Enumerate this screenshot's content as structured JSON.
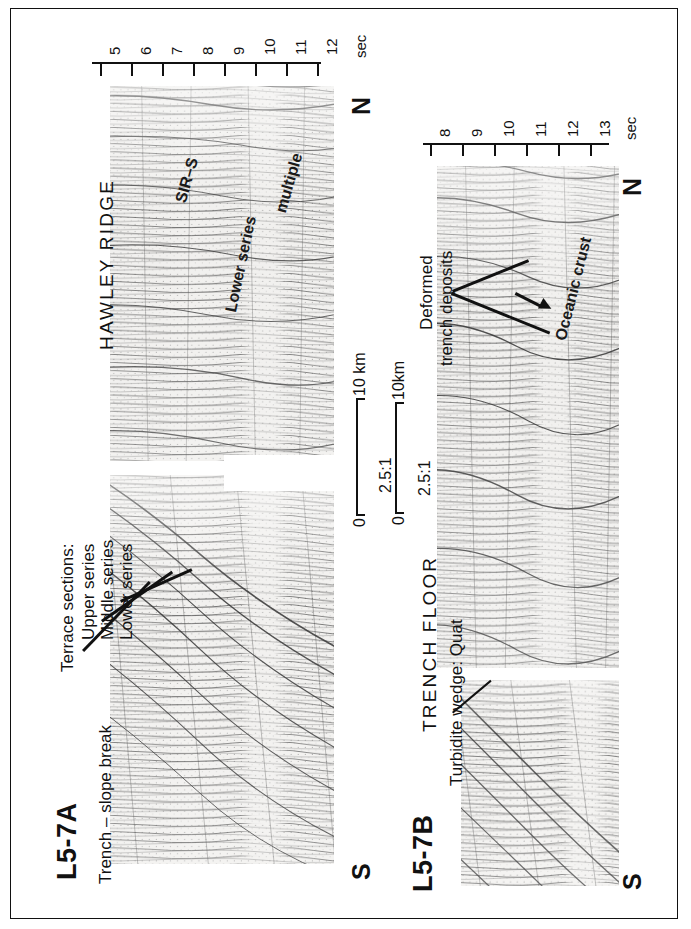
{
  "figure": {
    "orientation": "rotated-90-ccw",
    "background": "#ffffff",
    "ink": "#111111"
  },
  "panels": [
    {
      "id": "L5-7A",
      "title": "L5-7A",
      "region_label": "HAWLEY RIDGE",
      "axis": {
        "unit_label": "sec",
        "ticks": [
          "5",
          "6",
          "7",
          "8",
          "9",
          "10",
          "11",
          "12"
        ],
        "min": 5,
        "max": 12
      },
      "direction_start": "S",
      "direction_end": "N",
      "scale": {
        "zero_label": "0",
        "length_label": "10 km",
        "exaggeration": "2.5:1"
      },
      "annotations": [
        {
          "name": "trench-slope-break",
          "text": "Trench – slope break"
        },
        {
          "name": "terrace-sections-header",
          "text": "Terrace sections:"
        },
        {
          "name": "upper-series",
          "text": "Upper series"
        },
        {
          "name": "middle-series",
          "text": "Middle series"
        },
        {
          "name": "lower-series-terrace",
          "text": "Lower series"
        },
        {
          "name": "sir-s-reflector",
          "text": "SIR–S"
        },
        {
          "name": "lower-series-ridge",
          "text": "Lower series"
        },
        {
          "name": "multiple-reflector",
          "text": "multiple"
        }
      ]
    },
    {
      "id": "L5-7B",
      "title": "L5-7B",
      "region_label": "TRENCH FLOOR",
      "axis": {
        "unit_label": "sec",
        "ticks": [
          "8",
          "9",
          "10",
          "11",
          "12",
          "13"
        ],
        "min": 8,
        "max": 13
      },
      "direction_start": "S",
      "direction_end": "N",
      "scale": {
        "zero_label": "0",
        "length_label": "10km",
        "exaggeration": "2.5:1"
      },
      "annotations": [
        {
          "name": "turbidite-wedge",
          "text": "Turbidite wedge: Quat"
        },
        {
          "name": "deformed-trench-deposits-l1",
          "text": "Deformed"
        },
        {
          "name": "deformed-trench-deposits-l2",
          "text": "trench deposits"
        },
        {
          "name": "oceanic-crust",
          "text": "Oceanic crust"
        }
      ]
    }
  ]
}
